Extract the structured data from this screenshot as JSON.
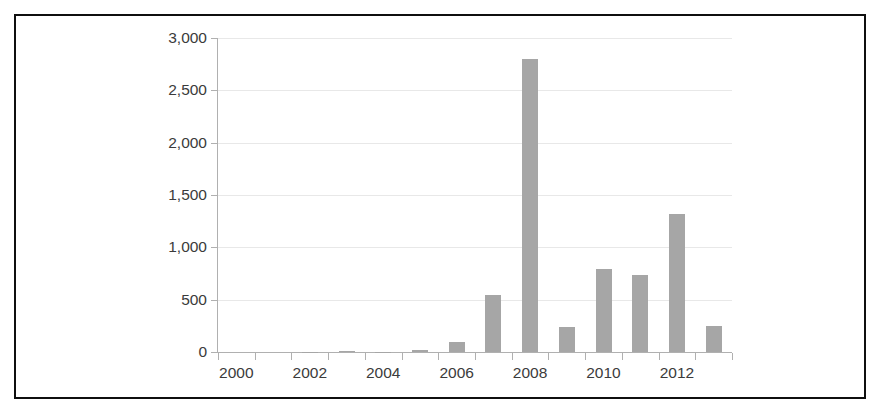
{
  "chart_data": {
    "type": "bar",
    "title": "",
    "subtitle": "",
    "xlabel": "",
    "ylabel": "",
    "categories": [
      "2000",
      "2001",
      "2002",
      "2003",
      "2004",
      "2005",
      "2006",
      "2007",
      "2008",
      "2009",
      "2010",
      "2011",
      "2012",
      "2013"
    ],
    "values": [
      0,
      0,
      2,
      10,
      3,
      20,
      95,
      545,
      2800,
      240,
      790,
      735,
      1320,
      250
    ],
    "series": [
      {
        "name": "",
        "values": [
          0,
          0,
          2,
          10,
          3,
          20,
          95,
          545,
          2800,
          240,
          790,
          735,
          1320,
          250
        ]
      }
    ],
    "ylim": [
      0,
      3000
    ],
    "ytick_values": [
      0,
      500,
      1000,
      1500,
      2000,
      2500,
      3000
    ],
    "ytick_labels": [
      "0",
      "500",
      "1,000",
      "1,500",
      "2,000",
      "2,500",
      "3,000"
    ],
    "xtick_labels": [
      "2000",
      "2002",
      "2004",
      "2006",
      "2008",
      "2010",
      "2012"
    ],
    "xtick_categories": [
      "2000",
      "2002",
      "2004",
      "2006",
      "2008",
      "2010",
      "2012"
    ],
    "grid": true,
    "grid_axis": "y",
    "legend": false,
    "legend_position": "none",
    "bar_color": "#a6a6a6",
    "gridline_color": "#e8e8e8",
    "axis_color": "#b0b0b0",
    "tick_label_color": "#3b3b3b",
    "frame_color": "#0f0f0f",
    "background_color": "#ffffff"
  }
}
